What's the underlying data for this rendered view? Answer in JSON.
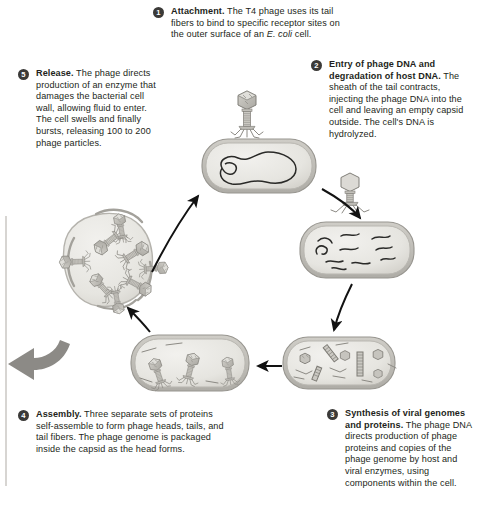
{
  "figure": {
    "organism": "E. coli",
    "phage": "T4"
  },
  "steps": [
    {
      "number": "1",
      "heading": "Attachment.",
      "body_before_italic": " The T4 phage uses its tail fibers to bind to specific receptor sites on the outer surface of an ",
      "italic": "E. coli",
      "body_after_italic": " cell."
    },
    {
      "number": "2",
      "heading": "Entry of phage DNA and degradation of host DNA.",
      "body_before_italic": " The sheath of the tail contracts, injecting the phage DNA into the cell and leaving an empty capsid outside. The cell's DNA is hydrolyzed.",
      "italic": "",
      "body_after_italic": ""
    },
    {
      "number": "3",
      "heading": "Synthesis of viral genomes and proteins.",
      "body_before_italic": " The phage DNA directs production of phage proteins and copies of the phage genome by host and viral enzymes, using components within the cell.",
      "italic": "",
      "body_after_italic": ""
    },
    {
      "number": "4",
      "heading": "Assembly.",
      "body_before_italic": " Three separate sets of proteins self-assemble to form phage heads, tails, and tail fibers. The phage genome is packaged inside the capsid as the head forms.",
      "italic": "",
      "body_after_italic": ""
    },
    {
      "number": "5",
      "heading": "Release.",
      "body_before_italic": " The phage directs production of an enzyme that damages the bacterial cell wall, allowing fluid to enter. The cell swells and finally bursts, releasing 100 to 200 phage particles.",
      "italic": "",
      "body_after_italic": ""
    }
  ],
  "illustrations": [
    {
      "name": "phage-attached-to-cell",
      "caption_step": "1"
    },
    {
      "name": "cell-with-hydrolyzed-dna",
      "caption_step": "2"
    },
    {
      "name": "cell-with-phage-components",
      "caption_step": "3"
    },
    {
      "name": "cell-with-assembled-phages",
      "caption_step": "4"
    },
    {
      "name": "lysed-cell-releasing-phages",
      "caption_step": "5"
    }
  ],
  "arrows": [
    {
      "name": "arrow-step1-to-step2",
      "direction": "down-right"
    },
    {
      "name": "arrow-step2-to-step3",
      "direction": "down-left"
    },
    {
      "name": "arrow-step3-to-step4",
      "direction": "left"
    },
    {
      "name": "arrow-step4-to-step5",
      "direction": "up-left"
    },
    {
      "name": "arrow-step5-to-step1",
      "direction": "up-right"
    },
    {
      "name": "arrow-release-outward",
      "direction": "left"
    }
  ],
  "colors": {
    "badge_fill": "#3b3a38",
    "badge_text": "#ffffff",
    "text": "#231f20",
    "cell_fill": "#e7e6e2",
    "cell_wall": "#b9b7b1",
    "phage_fill": "#bdbbb5",
    "phage_stroke": "#7b7974",
    "big_arrow": "#8c8a86",
    "thin_arrow": "#121212",
    "rule": "#d7d5d2",
    "background": "#ffffff"
  }
}
